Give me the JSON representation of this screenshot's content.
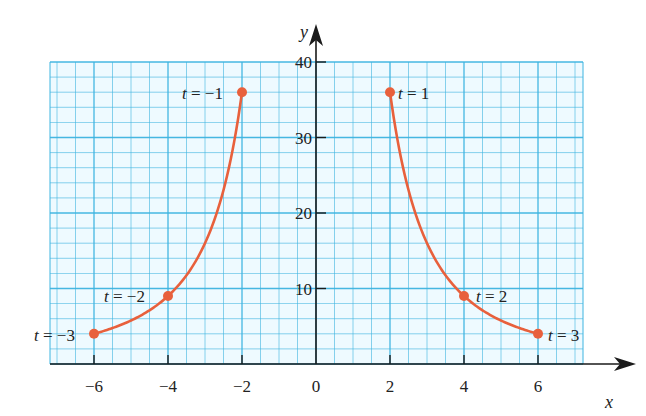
{
  "chart_data": {
    "type": "line",
    "title": "",
    "xlabel": "x",
    "ylabel": "y",
    "xlim": [
      -7.3,
      7.3
    ],
    "ylim": [
      0,
      40
    ],
    "grid": true,
    "x_ticks": [
      -6,
      -4,
      -2,
      0,
      2,
      4,
      6
    ],
    "x_tick_labels": [
      "−6",
      "−4",
      "−2",
      "0",
      "2",
      "4",
      "6"
    ],
    "y_ticks": [
      10,
      20,
      30,
      40
    ],
    "y_tick_labels": [
      "10",
      "20",
      "30",
      "40"
    ],
    "series": [
      {
        "name": "left branch",
        "parameter_t": [
          -3,
          -2,
          -1
        ],
        "x": [
          -6,
          -4,
          -2
        ],
        "y": [
          4,
          9,
          36
        ],
        "labels": [
          "t = −3",
          "t = −2",
          "t = −1"
        ]
      },
      {
        "name": "right branch",
        "parameter_t": [
          1,
          2,
          3
        ],
        "x": [
          2,
          4,
          6
        ],
        "y": [
          36,
          9,
          4
        ],
        "labels": [
          "t = 1",
          "t = 2",
          "t = 3"
        ]
      }
    ],
    "curve_color": "#e8603c",
    "grid_color": "#3cb4e0",
    "grid_bg": "#eefaff"
  },
  "labels": {
    "x_axis": "x",
    "y_axis": "y",
    "t_m3": {
      "t": "t",
      "eq": " = −3"
    },
    "t_m2": {
      "t": "t",
      "eq": " = −2"
    },
    "t_m1": {
      "t": "t",
      "eq": " = −1"
    },
    "t_1": {
      "t": "t",
      "eq": " = 1"
    },
    "t_2": {
      "t": "t",
      "eq": " = 2"
    },
    "t_3": {
      "t": "t",
      "eq": " = 3"
    }
  }
}
